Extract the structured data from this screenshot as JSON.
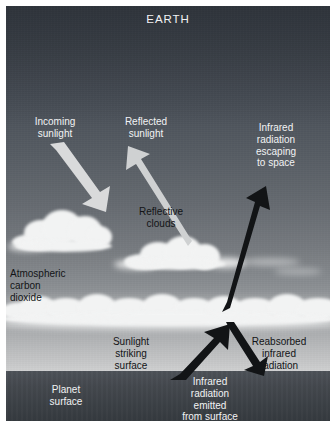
{
  "diagram": {
    "title": "EARTH",
    "colors": {
      "sky_top": "#3c424a",
      "sky_bottom": "#e8e9e9",
      "ground": "#44484e",
      "cloud": "#f2f3f3",
      "light_text": "#f2f3f4",
      "dark_text": "#121416",
      "light_arrow": "#d9dadb",
      "dark_arrow": "#121416"
    },
    "labels": {
      "incoming_sunlight": "Incoming\nsunlight",
      "reflected_sunlight": "Reflected\nsunlight",
      "infrared_escaping": "Infrared\nradiation\nescaping\nto space",
      "reflective_clouds": "Reflective\nclouds",
      "atmospheric_co2": "Atmospheric\ncarbon\ndioxide",
      "sunlight_striking_surface": "Sunlight\nstriking\nsurface",
      "reabsorbed_infrared": "Reabsorbed\ninfrared\nradiation",
      "planet_surface": "Planet\nsurface",
      "infrared_emitted": "Infrared\nradiation\nemitted\nfrom surface"
    },
    "arrows": [
      {
        "name": "incoming-sunlight-arrow",
        "direction": "down-right",
        "tone": "light"
      },
      {
        "name": "reflected-sunlight-arrow",
        "direction": "up-left",
        "tone": "light"
      },
      {
        "name": "infrared-escaping-arrow",
        "direction": "up-right",
        "tone": "dark"
      },
      {
        "name": "infrared-emitted-arrow",
        "direction": "up-left",
        "tone": "dark"
      },
      {
        "name": "reabsorbed-infrared-arrow",
        "direction": "down-right",
        "tone": "dark"
      }
    ]
  }
}
